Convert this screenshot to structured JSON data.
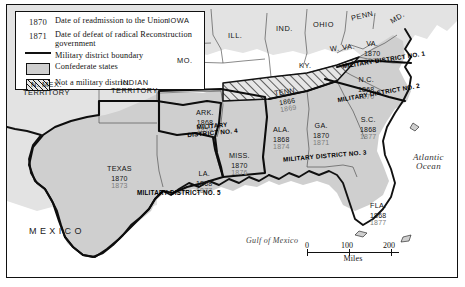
{
  "map": {
    "title": "Reconstruction Military Districts",
    "colors": {
      "confederate_fill": "#cfcfcf",
      "nonconfederate_fill": "#e3e3e3",
      "water_fill": "#ffffff",
      "boundary": "#111111",
      "readmission_year_color": "#141414",
      "defeat_year_color": "#7d7d7d"
    },
    "legend": {
      "rows": [
        {
          "key": "1870",
          "key_type": "year",
          "text": "Date of readmission to the Union"
        },
        {
          "key": "1871",
          "key_type": "year",
          "text": "Date of defeat of radical Reconstruction government"
        },
        {
          "key": "",
          "key_type": "line",
          "text": "Military district boundary"
        },
        {
          "key": "",
          "key_type": "box",
          "text": "Confederate states"
        },
        {
          "key": "",
          "key_type": "hatch",
          "text": "Not a military district"
        }
      ]
    },
    "scale": {
      "ticks": [
        "0",
        "100",
        "200"
      ],
      "caption": "Miles"
    },
    "water_labels": [
      {
        "name": "atlantic-ocean",
        "line1": "Atlantic",
        "line2": "Ocean"
      },
      {
        "name": "gulf-of-mexico",
        "line1": "Gulf of Mexico",
        "line2": ""
      }
    ],
    "country_labels": [
      {
        "name": "mexico",
        "label": "MEXICO"
      }
    ],
    "military_districts": [
      {
        "id": 1,
        "label": "MILITARY DISTRICT NO. 1"
      },
      {
        "id": 2,
        "label": "MILITARY DISTRICT NO. 2"
      },
      {
        "id": 3,
        "label": "MILITARY DISTRICT NO. 3"
      },
      {
        "id": 4,
        "label": "MILITARY DISTRICT NO. 4",
        "label_line1": "MILITARY",
        "label_line2": "DISTRICT NO. 4"
      },
      {
        "id": 5,
        "label": "MILITARY DISTRICT NO. 5"
      }
    ],
    "confederate_states": [
      {
        "abbr": "VA.",
        "readmitted": "1870",
        "defeated": "1870",
        "district": 1,
        "hatched": false
      },
      {
        "abbr": "N.C.",
        "readmitted": "1868",
        "defeated": "1870",
        "district": 2,
        "hatched": false
      },
      {
        "abbr": "S.C.",
        "readmitted": "1868",
        "defeated": "1877",
        "district": 2,
        "hatched": false
      },
      {
        "abbr": "GA.",
        "readmitted": "1870",
        "defeated": "1871",
        "district": 3,
        "hatched": false
      },
      {
        "abbr": "FLA.",
        "readmitted": "1868",
        "defeated": "1877",
        "district": 3,
        "hatched": false
      },
      {
        "abbr": "ALA.",
        "readmitted": "1868",
        "defeated": "1874",
        "district": 3,
        "hatched": false
      },
      {
        "abbr": "MISS.",
        "readmitted": "1870",
        "defeated": "1876",
        "district": 4,
        "hatched": false
      },
      {
        "abbr": "ARK.",
        "readmitted": "1868",
        "defeated": "1874",
        "district": 4,
        "hatched": false
      },
      {
        "abbr": "LA.",
        "readmitted": "1868",
        "defeated": "1877",
        "district": 5,
        "hatched": false
      },
      {
        "abbr": "TEXAS",
        "readmitted": "1870",
        "defeated": "1873",
        "district": 5,
        "hatched": false
      },
      {
        "abbr": "TENN.",
        "readmitted": "1866",
        "defeated": "1869",
        "district": null,
        "hatched": true
      }
    ],
    "other_states": [
      {
        "label": "IOWA"
      },
      {
        "label": "ILL."
      },
      {
        "label": "IND."
      },
      {
        "label": "OHIO"
      },
      {
        "label": "PENN."
      },
      {
        "label": "MD."
      },
      {
        "label": "W. VA."
      },
      {
        "label": "KY."
      },
      {
        "label": "MO."
      },
      {
        "label": "N. MEX.",
        "label2": "TERRITORY"
      },
      {
        "label": "INDIAN",
        "label2": "TERRITORY"
      }
    ]
  }
}
